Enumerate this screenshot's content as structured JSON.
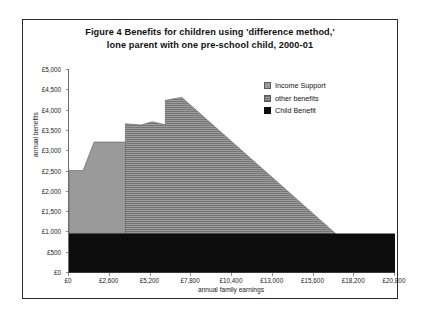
{
  "figure": {
    "title_line1": "Figure 4   Benefits for children using 'difference method,'",
    "title_line2": "lone parent with one pre-school child, 2000-01"
  },
  "legend": {
    "position": "inside-top-right",
    "items": [
      {
        "label": "Income Support",
        "swatch": "income-support-swatch",
        "color": "#9a9a9a"
      },
      {
        "label": "other benefits",
        "swatch": "other-benefits-swatch",
        "color": "#9a9a9a"
      },
      {
        "label": "Child Benefit",
        "swatch": "child-benefit-swatch",
        "color": "#0d0d0d"
      }
    ]
  },
  "chart_data": {
    "type": "area",
    "title": "Figure 4   Benefits for children using 'difference method,' lone parent with one pre-school child, 2000-01",
    "xlabel": "annual family earnings",
    "ylabel": "annual benefits",
    "xlim": [
      0,
      20800
    ],
    "ylim": [
      0,
      5000
    ],
    "grid": false,
    "stacked": true,
    "x_ticks": [
      "£0",
      "£2,600",
      "£5,200",
      "£7,800",
      "£10,400",
      "£13,000",
      "£15,600",
      "£18,200",
      "£20,800"
    ],
    "x_tick_values": [
      0,
      2600,
      5200,
      7800,
      10400,
      13000,
      15600,
      18200,
      20800
    ],
    "y_ticks": [
      "£0",
      "£500",
      "£1,000",
      "£1,500",
      "£2,000",
      "£2,500",
      "£3,000",
      "£3,500",
      "£4,000",
      "£4,500",
      "£5,000"
    ],
    "y_tick_values": [
      0,
      500,
      1000,
      1500,
      2000,
      2500,
      3000,
      3500,
      4000,
      4500,
      5000
    ],
    "series": [
      {
        "name": "Child Benefit",
        "color": "#0d0d0d",
        "fill": "solid",
        "x": [
          0,
          20800
        ],
        "cumulative_top": [
          950,
          950
        ]
      },
      {
        "name": "Income Support",
        "color": "#9a9a9a",
        "fill": "solid",
        "x": [
          0,
          900,
          1600,
          3600
        ],
        "cumulative_top": [
          2500,
          2500,
          3200,
          3200
        ]
      },
      {
        "name": "other benefits",
        "color": "#9a9a9a",
        "fill": "horizontal-hatch",
        "x": [
          3600,
          3600,
          4600,
          5300,
          6000,
          6150,
          6150,
          7200,
          17000
        ],
        "cumulative_top": [
          950,
          3650,
          3620,
          3700,
          3640,
          3620,
          4230,
          4300,
          950
        ]
      }
    ]
  }
}
